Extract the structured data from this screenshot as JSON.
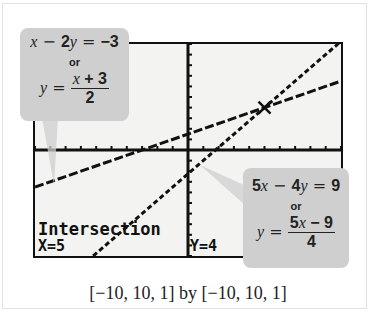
{
  "chart_data": {
    "type": "line",
    "title": "",
    "xlabel": "",
    "ylabel": "",
    "xlim": [
      -10,
      10
    ],
    "ylim": [
      -10,
      10
    ],
    "xscale": 1,
    "yscale": 1,
    "grid": false,
    "window_caption": "[−10, 10, 1] by [−10, 10, 1]",
    "series": [
      {
        "name": "x − 2y = −3",
        "equation": "y = (x + 3)/2",
        "slope": 0.5,
        "intercept": 1.5,
        "x": [
          -10,
          10
        ],
        "y": [
          -3.5,
          6.5
        ]
      },
      {
        "name": "5x − 4y = 9",
        "equation": "y = (5x − 9)/4",
        "slope": 1.25,
        "intercept": -2.25,
        "x": [
          -6.2,
          10
        ],
        "y": [
          -10,
          10.25
        ]
      }
    ],
    "annotations": [
      {
        "text": "Intersection",
        "position": "bottom-left"
      },
      {
        "text": "X=5",
        "position": "bottom-left"
      },
      {
        "text": "Y=4",
        "position": "bottom-center"
      },
      {
        "text": "intersection point",
        "x": 5,
        "y": 4
      }
    ]
  },
  "callouts": {
    "left": {
      "standard_form": {
        "lhs_a": "x",
        "op1": " − ",
        "coef": "2",
        "var": "y",
        "eq": " = ",
        "rhs": "−3"
      },
      "or": "or",
      "slope_form": {
        "y": "y",
        "eq": " = ",
        "numerator_var": "x",
        "numerator_rest": " + 3",
        "denominator": "2"
      }
    },
    "right": {
      "standard_form": {
        "coef1": "5",
        "var1": "x",
        "op1": " − ",
        "coef2": "4",
        "var2": "y",
        "eq": " = ",
        "rhs": "9"
      },
      "or": "or",
      "slope_form": {
        "y": "y",
        "eq": " = ",
        "numerator_coef": "5",
        "numerator_var": "x",
        "numerator_rest": " − 9",
        "denominator": "4"
      }
    }
  },
  "screen": {
    "intersection_label": "Intersection",
    "x_readout": "X=5",
    "y_readout": "Y=4"
  },
  "caption": "[−10, 10, 1] by [−10, 10, 1]"
}
